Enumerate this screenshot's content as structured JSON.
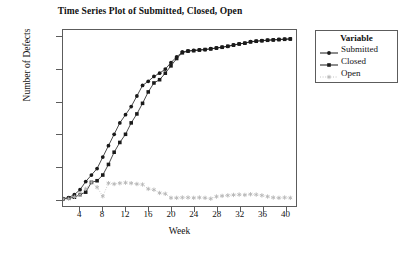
{
  "chart_data": {
    "type": "line",
    "title": "Time Series Plot of Submitted, Closed, Open",
    "xlabel": "Week",
    "ylabel": "Number of Defects",
    "xlim": [
      1,
      42
    ],
    "ylim": [
      -40,
      1040
    ],
    "grid": false,
    "legend_title": "Variable",
    "legend_position": "right-outside",
    "xticks": [
      4,
      8,
      12,
      16,
      20,
      24,
      28,
      32,
      36,
      40
    ],
    "yticks": [
      0,
      200,
      400,
      600,
      800,
      1000
    ],
    "x": [
      1,
      2,
      3,
      4,
      5,
      6,
      7,
      8,
      9,
      10,
      11,
      12,
      13,
      14,
      15,
      16,
      17,
      18,
      19,
      20,
      21,
      22,
      23,
      24,
      25,
      26,
      27,
      28,
      29,
      30,
      31,
      32,
      33,
      34,
      35,
      36,
      37,
      38,
      39,
      40,
      41
    ],
    "series": [
      {
        "name": "Submitted",
        "marker": "filled-circle",
        "line": "solid",
        "color": "#1a1a1a",
        "values": [
          5,
          12,
          30,
          60,
          110,
          150,
          190,
          260,
          330,
          400,
          470,
          520,
          570,
          635,
          700,
          725,
          755,
          775,
          800,
          840,
          875,
          905,
          912,
          915,
          918,
          920,
          925,
          930,
          935,
          940,
          948,
          955,
          960,
          968,
          972,
          975,
          978,
          980,
          982,
          984,
          985
        ]
      },
      {
        "name": "Closed",
        "marker": "filled-square",
        "line": "solid",
        "color": "#1a1a1a",
        "values": [
          3,
          8,
          14,
          30,
          45,
          105,
          115,
          150,
          215,
          290,
          350,
          400,
          470,
          525,
          590,
          660,
          715,
          735,
          775,
          820,
          865,
          900,
          910,
          913,
          917,
          920,
          924,
          929,
          934,
          940,
          947,
          954,
          959,
          967,
          971,
          974,
          977,
          979,
          981,
          983,
          985
        ]
      },
      {
        "name": "Open",
        "marker": "star",
        "line": "dotted",
        "color": "#b5b5b5",
        "values": [
          2,
          4,
          16,
          30,
          65,
          105,
          75,
          20,
          100,
          95,
          100,
          103,
          100,
          95,
          92,
          65,
          60,
          40,
          35,
          10,
          10,
          12,
          12,
          10,
          12,
          10,
          5,
          18,
          22,
          25,
          28,
          30,
          28,
          32,
          30,
          25,
          18,
          12,
          10,
          12,
          10
        ]
      }
    ]
  }
}
